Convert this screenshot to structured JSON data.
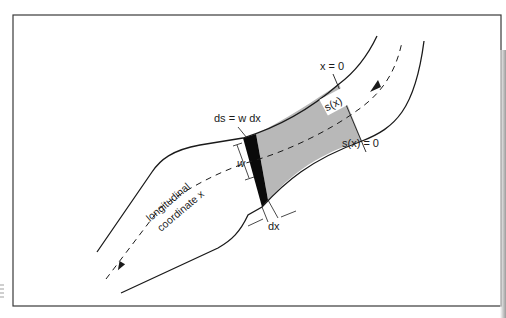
{
  "figure": {
    "type": "channel-diagram",
    "labels": {
      "ds_eq": "ds = w dx",
      "w": "w",
      "dx": "dx",
      "x_zero": "x = 0",
      "s_of_x": "s(x)",
      "s_zero": "s(x) = 0",
      "longitudinal": "longitudinal",
      "coordinate": "coordinate x"
    },
    "colors": {
      "frame": "#3a3a3a",
      "line": "#1a1a1a",
      "shaded_region": "#b8b8b8",
      "element": "#0a0a0a",
      "background": "#ffffff"
    }
  }
}
